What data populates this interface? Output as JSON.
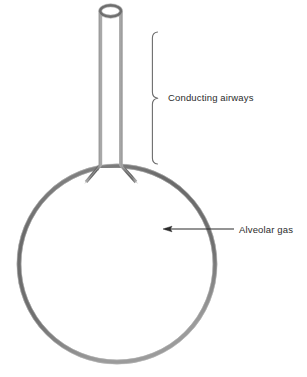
{
  "figure": {
    "background_color": "#ffffff",
    "stroke_color": "#6e6e6e",
    "stroke_highlight_color": "#9a9a9a",
    "annotation_color": "#2b2b2b",
    "width": 307,
    "height": 377
  },
  "shapes": {
    "airway_tube": {
      "name": "conducting-airway-tube",
      "left_wall_x": 100,
      "right_wall_x": 121,
      "top_y": 11,
      "bottom_y": 172,
      "wall_thickness": 3
    },
    "tube_opening": {
      "name": "airway-opening-ellipse",
      "center_x": 110.5,
      "center_y": 11,
      "radius_x": 11,
      "radius_y": 6
    },
    "alveolus": {
      "name": "alveolar-sac-circle",
      "center_x": 117,
      "center_y": 264,
      "radius": 98,
      "wall_thickness": 4
    }
  },
  "annotations": [
    {
      "id": "conducting-airways",
      "label": "Conducting airways",
      "pointer_type": "brace",
      "brace": {
        "x": 152,
        "top_y": 32,
        "bottom_y": 164,
        "tip_x": 158,
        "tip_y": 98,
        "hook_length": 5
      },
      "text_x": 168,
      "text_y": 101
    },
    {
      "id": "alveolar-gas",
      "label": "Alveolar gas",
      "pointer_type": "arrow",
      "arrow": {
        "from_x": 234,
        "from_y": 229,
        "to_x": 163,
        "to_y": 229,
        "head_length": 8,
        "head_width": 5
      },
      "text_x": 239,
      "text_y": 232
    }
  ]
}
